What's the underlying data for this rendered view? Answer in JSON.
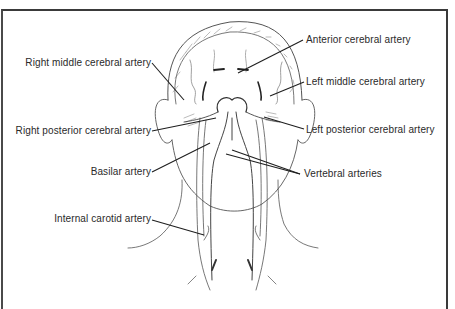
{
  "diagram": {
    "labels": {
      "right_middle_cerebral": "Right middle cerebral artery",
      "anterior_cerebral": "Anterior cerebral artery",
      "left_middle_cerebral": "Left middle cerebral artery",
      "right_posterior_cerebral": "Right posterior cerebral artery",
      "left_posterior_cerebral": "Left posterior cerebral artery",
      "basilar": "Basilar artery",
      "vertebral": "Vertebral arteries",
      "internal_carotid": "Internal carotid artery"
    },
    "colors": {
      "line": "#2a2a2a",
      "sketch": "#555555",
      "frame": "#3a3a3a",
      "background": "#ffffff"
    }
  }
}
